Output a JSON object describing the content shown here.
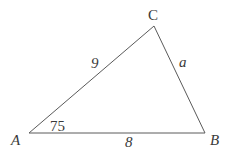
{
  "diagram": {
    "type": "triangle",
    "stroke_color": "#5a5a5a",
    "text_color": "#3a3a3a",
    "background": "#ffffff",
    "vertices": {
      "A": {
        "label": "A",
        "x": 29,
        "y": 133
      },
      "B": {
        "label": "B",
        "x": 205,
        "y": 133
      },
      "C": {
        "label": "C",
        "x": 154,
        "y": 26
      }
    },
    "sides": {
      "AC": {
        "label": "9"
      },
      "CB": {
        "label": "a"
      },
      "AB": {
        "label": "8"
      }
    },
    "angles": {
      "A": {
        "label": "75"
      }
    }
  }
}
